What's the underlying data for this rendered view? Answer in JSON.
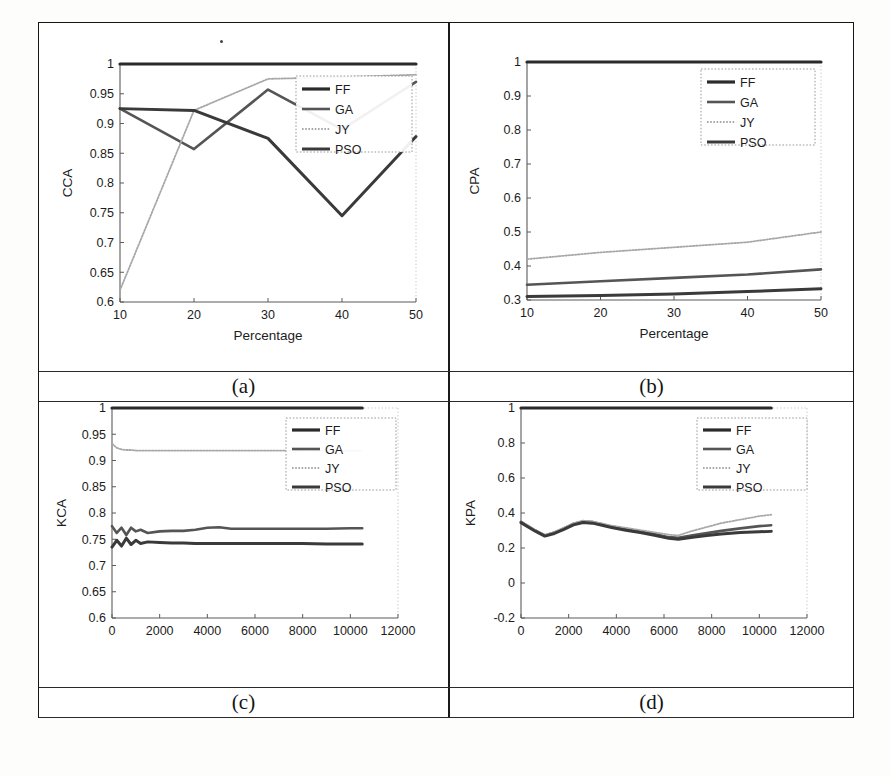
{
  "figure": {
    "captions": {
      "a": "(a)",
      "b": "(b)",
      "c": "(c)",
      "d": "(d)"
    }
  },
  "legend": {
    "entries": [
      "FF",
      "GA",
      "JY",
      "PSO"
    ],
    "ff": "FF",
    "ga": "GA",
    "jy": "JY",
    "pso": "PSO"
  },
  "colors": {
    "ff": "#2b2b2b",
    "ga": "#555555",
    "jy": "#a8a8a8",
    "pso": "#3a3a3a",
    "axis": "#5a5a5a",
    "frame": "#151515",
    "text": "#1c1c1c"
  },
  "panel_a": {
    "ylabel": "CCA",
    "xlabel": "Percentage",
    "xticks": [
      "10",
      "20",
      "30",
      "40",
      "50"
    ],
    "yticks": [
      "0.6",
      "0.65",
      "0.7",
      "0.75",
      "0.8",
      "0.85",
      "0.9",
      "0.95",
      "1"
    ]
  },
  "panel_b": {
    "ylabel": "CPA",
    "xlabel": "Percentage",
    "xticks": [
      "10",
      "20",
      "30",
      "40",
      "50"
    ],
    "yticks": [
      "0.3",
      "0.4",
      "0.5",
      "0.6",
      "0.7",
      "0.8",
      "0.9",
      "1"
    ]
  },
  "panel_c": {
    "ylabel": "KCA",
    "xlabel": "",
    "xticks": [
      "0",
      "2000",
      "4000",
      "6000",
      "8000",
      "10000",
      "12000"
    ],
    "yticks": [
      "0.6",
      "0.65",
      "0.7",
      "0.75",
      "0.8",
      "0.85",
      "0.9",
      "0.95",
      "1"
    ]
  },
  "panel_d": {
    "ylabel": "KPA",
    "xlabel": "",
    "xticks": [
      "0",
      "2000",
      "4000",
      "6000",
      "8000",
      "10000",
      "12000"
    ],
    "yticks": [
      "-0.2",
      "0",
      "0.2",
      "0.4",
      "0.6",
      "0.8",
      "1"
    ]
  },
  "chart_data": [
    {
      "id": "a",
      "type": "line",
      "title": "(a)",
      "xlabel": "Percentage",
      "ylabel": "CCA",
      "xlim": [
        10,
        50
      ],
      "ylim": [
        0.6,
        1.0
      ],
      "xticks": [
        10,
        20,
        30,
        40,
        50
      ],
      "yticks": [
        0.6,
        0.65,
        0.7,
        0.75,
        0.8,
        0.85,
        0.9,
        0.95,
        1
      ],
      "grid": false,
      "legend_position": "upper-right",
      "x": [
        10,
        20,
        30,
        40,
        50
      ],
      "series": [
        {
          "name": "FF",
          "values": [
            1.0,
            1.0,
            1.0,
            1.0,
            1.0
          ]
        },
        {
          "name": "GA",
          "values": [
            0.925,
            0.857,
            0.957,
            0.89,
            0.97
          ]
        },
        {
          "name": "JY",
          "values": [
            0.62,
            0.922,
            0.975,
            0.978,
            0.982
          ]
        },
        {
          "name": "PSO",
          "values": [
            0.925,
            0.922,
            0.875,
            0.745,
            0.878
          ]
        }
      ]
    },
    {
      "id": "b",
      "type": "line",
      "title": "(b)",
      "xlabel": "Percentage",
      "ylabel": "CPA",
      "xlim": [
        10,
        50
      ],
      "ylim": [
        0.3,
        1.0
      ],
      "xticks": [
        10,
        20,
        30,
        40,
        50
      ],
      "yticks": [
        0.3,
        0.4,
        0.5,
        0.6,
        0.7,
        0.8,
        0.9,
        1
      ],
      "grid": false,
      "legend_position": "upper-right",
      "x": [
        10,
        20,
        30,
        40,
        50
      ],
      "series": [
        {
          "name": "FF",
          "values": [
            1.0,
            1.0,
            1.0,
            1.0,
            1.0
          ]
        },
        {
          "name": "GA",
          "values": [
            0.345,
            0.355,
            0.365,
            0.375,
            0.39
          ]
        },
        {
          "name": "JY",
          "values": [
            0.42,
            0.44,
            0.455,
            0.47,
            0.5
          ]
        },
        {
          "name": "PSO",
          "values": [
            0.31,
            0.313,
            0.318,
            0.325,
            0.333
          ]
        }
      ]
    },
    {
      "id": "c",
      "type": "line",
      "title": "(c)",
      "xlabel": "",
      "ylabel": "KCA",
      "xlim": [
        0,
        12000
      ],
      "ylim": [
        0.6,
        1.0
      ],
      "xticks": [
        0,
        2000,
        4000,
        6000,
        8000,
        10000,
        12000
      ],
      "yticks": [
        0.6,
        0.65,
        0.7,
        0.75,
        0.8,
        0.85,
        0.9,
        0.95,
        1
      ],
      "grid": false,
      "legend_position": "upper-right",
      "x": [
        0,
        200,
        400,
        600,
        800,
        1000,
        1200,
        1500,
        2000,
        2500,
        3000,
        3500,
        4000,
        4500,
        5000,
        6000,
        7000,
        8000,
        9000,
        10000,
        10500
      ],
      "series": [
        {
          "name": "FF",
          "values": [
            1,
            1,
            1,
            1,
            1,
            1,
            1,
            1,
            1,
            1,
            1,
            1,
            1,
            1,
            1,
            1,
            1,
            1,
            1,
            1,
            1
          ]
        },
        {
          "name": "GA",
          "values": [
            0.775,
            0.762,
            0.772,
            0.758,
            0.772,
            0.765,
            0.768,
            0.762,
            0.765,
            0.766,
            0.766,
            0.768,
            0.772,
            0.773,
            0.77,
            0.77,
            0.77,
            0.77,
            0.77,
            0.771,
            0.771
          ]
        },
        {
          "name": "JY",
          "values": [
            0.932,
            0.924,
            0.921,
            0.92,
            0.92,
            0.919,
            0.919,
            0.919,
            0.919,
            0.919,
            0.919,
            0.919,
            0.919,
            0.919,
            0.919,
            0.919,
            0.919,
            0.919,
            0.919,
            0.919,
            0.919
          ]
        },
        {
          "name": "PSO",
          "values": [
            0.735,
            0.748,
            0.737,
            0.752,
            0.74,
            0.748,
            0.742,
            0.745,
            0.744,
            0.743,
            0.743,
            0.742,
            0.742,
            0.742,
            0.742,
            0.742,
            0.742,
            0.742,
            0.741,
            0.741,
            0.741
          ]
        }
      ]
    },
    {
      "id": "d",
      "type": "line",
      "title": "(d)",
      "xlabel": "",
      "ylabel": "KPA",
      "xlim": [
        0,
        12000
      ],
      "ylim": [
        -0.2,
        1.0
      ],
      "xticks": [
        0,
        2000,
        4000,
        6000,
        8000,
        10000,
        12000
      ],
      "yticks": [
        -0.2,
        0,
        0.2,
        0.4,
        0.6,
        0.8,
        1
      ],
      "grid": false,
      "legend_position": "upper-right",
      "x": [
        0,
        300,
        600,
        1000,
        1400,
        1800,
        2200,
        2600,
        3000,
        3400,
        3800,
        4400,
        5000,
        5600,
        6200,
        6600,
        7200,
        7800,
        8400,
        9200,
        10000,
        10500
      ],
      "series": [
        {
          "name": "FF",
          "values": [
            1,
            1,
            1,
            1,
            1,
            1,
            1,
            1,
            1,
            1,
            1,
            1,
            1,
            1,
            1,
            1,
            1,
            1,
            1,
            1,
            1,
            1
          ]
        },
        {
          "name": "GA",
          "values": [
            0.35,
            0.325,
            0.3,
            0.272,
            0.288,
            0.312,
            0.338,
            0.352,
            0.348,
            0.335,
            0.322,
            0.308,
            0.295,
            0.28,
            0.262,
            0.258,
            0.272,
            0.285,
            0.298,
            0.312,
            0.325,
            0.33
          ]
        },
        {
          "name": "JY",
          "values": [
            0.35,
            0.328,
            0.302,
            0.275,
            0.292,
            0.316,
            0.342,
            0.356,
            0.352,
            0.34,
            0.328,
            0.315,
            0.302,
            0.29,
            0.276,
            0.272,
            0.298,
            0.32,
            0.342,
            0.362,
            0.382,
            0.39
          ]
        },
        {
          "name": "PSO",
          "values": [
            0.345,
            0.32,
            0.296,
            0.268,
            0.283,
            0.306,
            0.332,
            0.346,
            0.342,
            0.33,
            0.317,
            0.302,
            0.288,
            0.273,
            0.255,
            0.25,
            0.262,
            0.272,
            0.28,
            0.288,
            0.293,
            0.295
          ]
        }
      ]
    }
  ]
}
